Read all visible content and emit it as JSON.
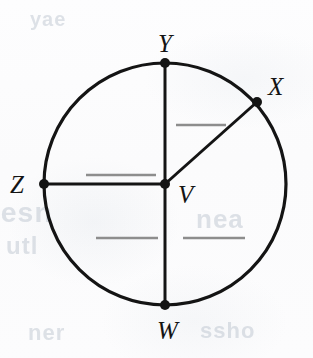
{
  "figure": {
    "type": "geometry-diagram",
    "shape": "circle",
    "background_color": "#fdfdfd",
    "stroke_color": "#141414",
    "blank_line_color": "#8d8d8d"
  },
  "circle": {
    "center_x": 165,
    "center_y": 184,
    "radius": 121,
    "stroke_width": 3.2
  },
  "labels": {
    "center": "V",
    "top": "Y",
    "upper_right": "X",
    "left": "Z",
    "bottom": "W"
  },
  "points": [
    {
      "name": "V",
      "label": "V",
      "x": 165,
      "y": 184,
      "role": "center",
      "dot": true
    },
    {
      "name": "Y",
      "label": "Y",
      "x": 165,
      "y": 63,
      "role": "on-circle-top",
      "dot": true
    },
    {
      "name": "X",
      "label": "X",
      "x": 257,
      "y": 102,
      "role": "on-circle-upper-right",
      "dot": true
    },
    {
      "name": "Z",
      "label": "Z",
      "x": 44,
      "y": 184,
      "role": "on-circle-left",
      "dot": true
    },
    {
      "name": "W",
      "label": "W",
      "x": 165,
      "y": 305,
      "role": "on-circle-bottom",
      "dot": true
    }
  ],
  "segments": [
    {
      "name": "segment-YW",
      "from": "Y",
      "to": "W",
      "kind": "diameter"
    },
    {
      "name": "segment-ZV",
      "from": "Z",
      "to": "V",
      "kind": "radius"
    },
    {
      "name": "segment-VX",
      "from": "V",
      "to": "X",
      "kind": "radius"
    }
  ],
  "answer_blanks": [
    {
      "name": "blank-upper-right",
      "x1": 176,
      "y1": 125,
      "x2": 226,
      "y2": 125
    },
    {
      "name": "blank-upper-left",
      "x1": 86,
      "y1": 175,
      "x2": 156,
      "y2": 175
    },
    {
      "name": "blank-lower-left",
      "x1": 96,
      "y1": 238,
      "x2": 158,
      "y2": 238
    },
    {
      "name": "blank-lower-right",
      "x1": 183,
      "y1": 238,
      "x2": 245,
      "y2": 238
    }
  ],
  "background_ghost_text": {
    "note": "faint illegible show-through from reverse of page",
    "fragments": [
      "esn",
      "utl",
      "nea",
      "ner",
      "ssho",
      "yae"
    ]
  }
}
